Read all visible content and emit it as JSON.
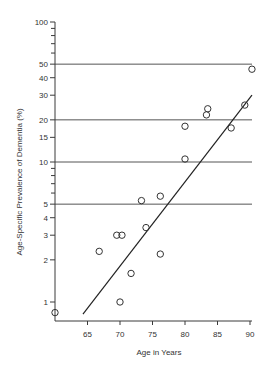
{
  "chart_data": {
    "type": "scatter",
    "title": "",
    "xlabel": "Age in Years",
    "ylabel": "Age-Specific Prevalence of Dementia (%)",
    "xscale": "linear",
    "yscale": "log",
    "xlim": [
      60,
      90
    ],
    "ylim": [
      0.8,
      100
    ],
    "x_ticks": [
      65,
      70,
      75,
      80,
      85,
      90
    ],
    "y_ticks_labeled": [
      1,
      2,
      3,
      4,
      5,
      10,
      15,
      20,
      30,
      40,
      50,
      100
    ],
    "y_ticks_minor": [
      6,
      7,
      8,
      9,
      60,
      70,
      80,
      90
    ],
    "grid": false,
    "reference_lines_y": [
      5,
      10,
      20,
      50
    ],
    "legend": null,
    "series": [
      {
        "name": "Studies",
        "marker": "open-circle",
        "points": [
          {
            "x": 60.0,
            "y": 0.84
          },
          {
            "x": 66.8,
            "y": 2.3
          },
          {
            "x": 69.5,
            "y": 3.0
          },
          {
            "x": 70.3,
            "y": 3.0
          },
          {
            "x": 70.0,
            "y": 1.0
          },
          {
            "x": 71.7,
            "y": 1.6
          },
          {
            "x": 73.3,
            "y": 5.3
          },
          {
            "x": 74.0,
            "y": 3.4
          },
          {
            "x": 76.2,
            "y": 2.2
          },
          {
            "x": 76.2,
            "y": 5.7
          },
          {
            "x": 80.0,
            "y": 10.5
          },
          {
            "x": 80.0,
            "y": 18.0
          },
          {
            "x": 83.3,
            "y": 21.7
          },
          {
            "x": 83.5,
            "y": 24.0
          },
          {
            "x": 87.1,
            "y": 17.5
          },
          {
            "x": 89.2,
            "y": 25.5
          },
          {
            "x": 90.3,
            "y": 46.0
          }
        ]
      },
      {
        "name": "Fitted line",
        "type": "line",
        "points": [
          {
            "x": 64.3,
            "y": 0.82
          },
          {
            "x": 90.3,
            "y": 30.0
          }
        ]
      }
    ]
  }
}
